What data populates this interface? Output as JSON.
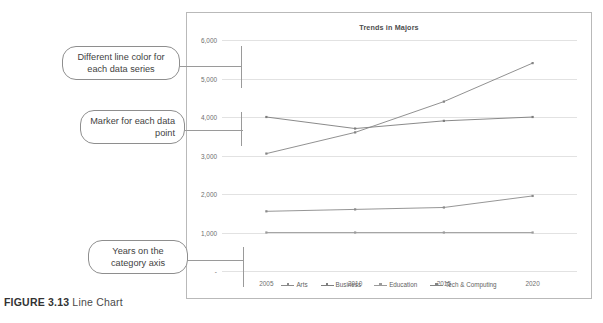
{
  "figure": {
    "label": "FIGURE 3.13",
    "title": "Line Chart"
  },
  "callouts": [
    {
      "id": "line-color",
      "text": "Different line color for each data series"
    },
    {
      "id": "marker",
      "text": "Marker for each data point"
    },
    {
      "id": "years",
      "text": "Years on the category axis"
    }
  ],
  "chart_data": {
    "type": "line",
    "title": "Trends in Majors",
    "xlabel": "",
    "ylabel": "",
    "categories": [
      "2005",
      "2010",
      "2015",
      "2020"
    ],
    "ylim": [
      0,
      6000
    ],
    "yticks": [
      "-",
      "1,000",
      "2,000",
      "3,000",
      "4,000",
      "5,000",
      "6,000"
    ],
    "ytick_values": [
      0,
      1000,
      2000,
      3000,
      4000,
      5000,
      6000
    ],
    "grid": true,
    "legend_position": "bottom",
    "series": [
      {
        "name": "Arts",
        "values": [
          1550,
          1600,
          1650,
          1950
        ],
        "color": "#8a8a8a"
      },
      {
        "name": "Business",
        "values": [
          4000,
          3700,
          3900,
          4000
        ],
        "color": "#7d7d7d"
      },
      {
        "name": "Education",
        "values": [
          1000,
          1000,
          1000,
          1000
        ],
        "color": "#9b9b9b"
      },
      {
        "name": "Tech & Computing",
        "values": [
          3050,
          3600,
          4400,
          5400
        ],
        "color": "#848484"
      }
    ]
  }
}
